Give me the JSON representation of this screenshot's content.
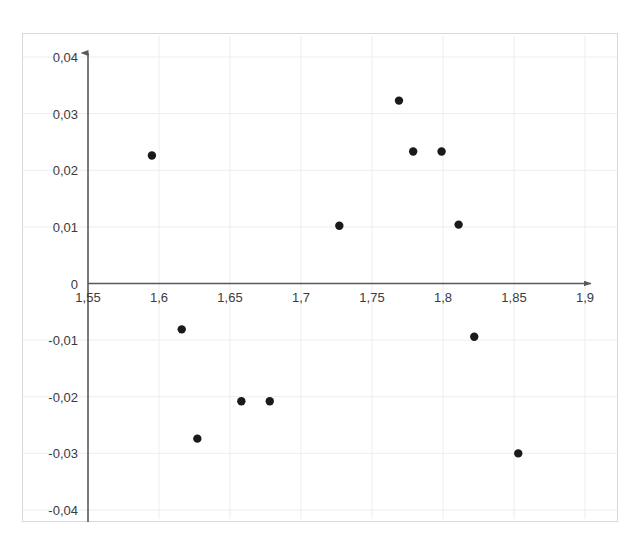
{
  "chart_data": {
    "type": "scatter",
    "title": "",
    "subtitle": "",
    "xlabel": "",
    "ylabel": "",
    "xlim": [
      1.55,
      1.9
    ],
    "ylim": [
      -0.04,
      0.04
    ],
    "grid": true,
    "legend": null,
    "x_ticks": [
      1.55,
      1.6,
      1.65,
      1.7,
      1.75,
      1.8,
      1.85,
      1.9
    ],
    "y_ticks": [
      0.04,
      0.03,
      0.02,
      0.01,
      0,
      -0.01,
      -0.02,
      -0.03,
      -0.04
    ],
    "x_tick_labels": [
      "1,55",
      "1,6",
      "1,65",
      "1,7",
      "1,75",
      "1,8",
      "1,85",
      "1,9"
    ],
    "y_tick_labels": [
      "0,04",
      "0,03",
      "0,02",
      "0,01",
      "0",
      "-0,01",
      "-0,02",
      "-0,03",
      "-0,04"
    ],
    "series": [
      {
        "name": "residuals",
        "marker": "circle",
        "color": "#1a1a1a",
        "points": [
          {
            "x": 1.595,
            "y": 0.0226
          },
          {
            "x": 1.616,
            "y": -0.0081
          },
          {
            "x": 1.627,
            "y": -0.0274
          },
          {
            "x": 1.658,
            "y": -0.0208
          },
          {
            "x": 1.678,
            "y": -0.0208
          },
          {
            "x": 1.727,
            "y": 0.0102
          },
          {
            "x": 1.769,
            "y": 0.0323
          },
          {
            "x": 1.779,
            "y": 0.0233
          },
          {
            "x": 1.799,
            "y": 0.0233
          },
          {
            "x": 1.811,
            "y": 0.0104
          },
          {
            "x": 1.822,
            "y": -0.0094
          },
          {
            "x": 1.853,
            "y": -0.03
          }
        ]
      }
    ],
    "axis_style": {
      "x_axis_arrow": true,
      "y_axis_arrow": true,
      "axis_color": "#595959",
      "grid_color": "#ededed",
      "frame_color": "#d9d9d9"
    }
  }
}
